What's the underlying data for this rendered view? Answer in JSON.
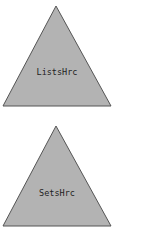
{
  "diagram": {
    "colors": {
      "triangle_fill": "#b3b3b3",
      "triangle_stroke": "#555555",
      "label": "#222222",
      "background": "#ffffff"
    },
    "nodes": [
      {
        "id": "lists",
        "shape": "triangle",
        "label": "ListsHrc",
        "apex": [
          56,
          6
        ],
        "base_left": [
          3,
          106
        ],
        "base_right": [
          111,
          106
        ],
        "label_pos": [
          57,
          75
        ]
      },
      {
        "id": "sets",
        "shape": "triangle",
        "label": "SetsHrc",
        "apex": [
          56,
          126
        ],
        "base_left": [
          3,
          226
        ],
        "base_right": [
          111,
          226
        ],
        "label_pos": [
          57,
          196
        ]
      }
    ],
    "footer_cutoff_text": ""
  }
}
